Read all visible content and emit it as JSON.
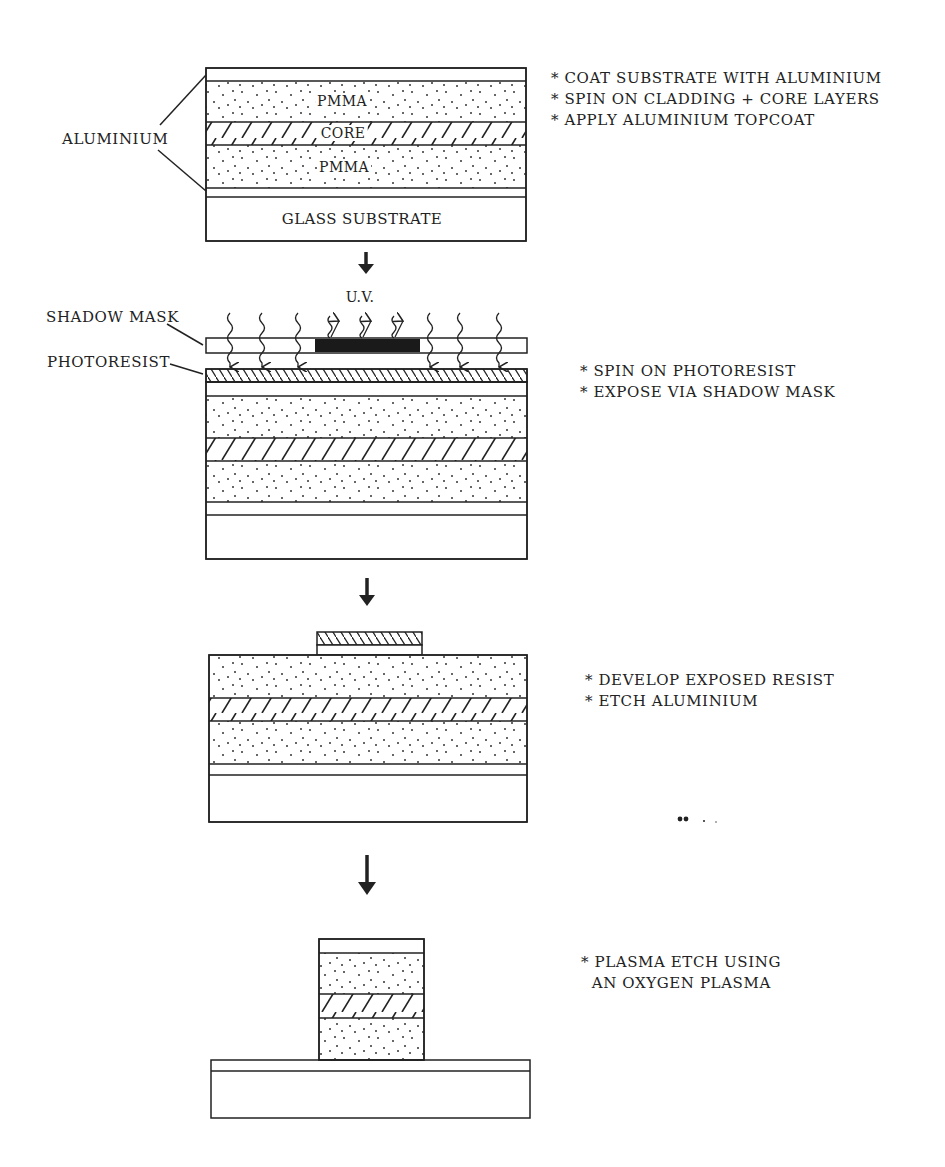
{
  "colors": {
    "ink": "#222222",
    "background": "#ffffff",
    "mask_block": "#1a1a1a"
  },
  "stage1": {
    "labels": {
      "aluminium": "ALUMINIUM",
      "pmma_top": "PMMA",
      "core": "CORE",
      "pmma_bottom": "PMMA",
      "glass": "GLASS SUBSTRATE"
    },
    "steps": [
      "* COAT SUBSTRATE WITH ALUMINIUM",
      "* SPIN ON CLADDING + CORE LAYERS",
      "* APPLY ALUMINIUM TOPCOAT"
    ]
  },
  "stage2": {
    "labels": {
      "uv": "U.V.",
      "shadow_mask": "SHADOW MASK",
      "photoresist": "PHOTORESIST"
    },
    "steps": [
      "* SPIN ON PHOTORESIST",
      "* EXPOSE VIA SHADOW MASK"
    ]
  },
  "stage3": {
    "steps": [
      "* DEVELOP EXPOSED RESIST",
      "* ETCH ALUMINIUM"
    ]
  },
  "stage4": {
    "steps": [
      "* PLASMA ETCH USING",
      "  AN OXYGEN PLASMA"
    ]
  },
  "arrows": [
    "process-arrow-1",
    "process-arrow-2",
    "process-arrow-3"
  ]
}
